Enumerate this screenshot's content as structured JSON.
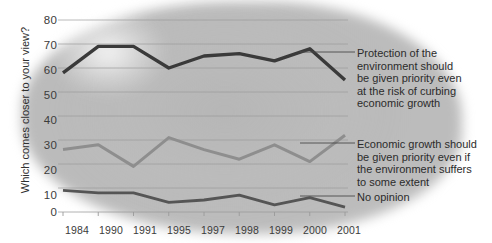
{
  "chart_data": {
    "type": "line",
    "title": "",
    "subtitle": "",
    "xlabel": "",
    "ylabel": "Which comes closer to your view?",
    "categories": [
      "1984",
      "1990",
      "1991",
      "1995",
      "1997",
      "1998",
      "1999",
      "2000",
      "2001"
    ],
    "ylim": [
      0,
      80
    ],
    "ytick_labels": [
      "0",
      "10",
      "20",
      "30",
      "40",
      "50",
      "60",
      "70",
      "80"
    ],
    "ytick_values": [
      0,
      10,
      20,
      30,
      40,
      50,
      60,
      70,
      80
    ],
    "grid": true,
    "legend_position": "right-annotations",
    "series": [
      {
        "name": "Protection of the environment should be given priority even at the risk of curbing economic growth",
        "color": "#3a3a3a",
        "values": [
          58,
          69,
          69,
          60,
          65,
          66,
          63,
          68,
          55
        ]
      },
      {
        "name": "Economic growth should be given priority even if the environment suffers to some extent",
        "color": "#8e8e8e",
        "values": [
          26,
          28,
          19,
          31,
          26,
          22,
          28,
          21,
          32
        ]
      },
      {
        "name": "No opinion",
        "color": "#555555",
        "values": [
          9,
          8,
          8,
          4,
          5,
          7,
          3,
          6,
          2
        ]
      }
    ],
    "annotations": [
      {
        "id": "annotation-environment",
        "text": "Protection of the environment should be given priority even at the risk of curbing economic growth",
        "lines": [
          "Protection of the",
          "environment should",
          "be given priority even",
          "at the risk of curbing",
          "economic growth"
        ],
        "target_series": 0
      },
      {
        "id": "annotation-economy",
        "text": "Economic growth should be given priority even if the environment suffers to some extent",
        "lines": [
          "Economic growth should",
          "be given priority even if",
          "the environment suffers",
          "to some extent"
        ],
        "target_series": 1
      },
      {
        "id": "annotation-no-opinion",
        "text": "No opinion",
        "lines": [
          "No opinion"
        ],
        "target_series": 2
      }
    ]
  },
  "axis": {
    "y_label": "Which comes closer to your view?",
    "y_ticks": [
      "80",
      "70",
      "60",
      "50",
      "40",
      "30",
      "20",
      "10",
      "0"
    ],
    "x_ticks": [
      "1984",
      "1990",
      "1991",
      "1995",
      "1997",
      "1998",
      "1999",
      "2000",
      "2001"
    ]
  },
  "annotation_text": {
    "env_l1": "Protection of the",
    "env_l2": "environment should",
    "env_l3": "be given priority even",
    "env_l4": "at the risk of curbing",
    "env_l5": "economic growth",
    "eco_l1": "Economic growth should",
    "eco_l2": "be given priority even if",
    "eco_l3": "the environment suffers",
    "eco_l4": "to some extent",
    "noop_l1": "No opinion"
  },
  "colors": {
    "series_environment": "#3a3a3a",
    "series_economy": "#8e8e8e",
    "series_no_opinion": "#555555",
    "grid": "#9a9a9a",
    "text": "#2b2b2b"
  }
}
